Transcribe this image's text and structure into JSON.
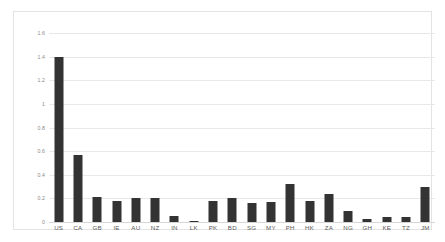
{
  "chart_data": {
    "type": "bar",
    "title": "",
    "subtitle": "",
    "xlabel": "",
    "ylabel": "",
    "categories": [
      "US",
      "CA",
      "GB",
      "IE",
      "AU",
      "NZ",
      "IN",
      "LK",
      "PK",
      "BD",
      "SG",
      "MY",
      "PH",
      "HK",
      "ZA",
      "NG",
      "GH",
      "KE",
      "TZ",
      "JM"
    ],
    "values": [
      1.4,
      0.57,
      0.21,
      0.18,
      0.2,
      0.2,
      0.055,
      0.01,
      0.18,
      0.2,
      0.16,
      0.17,
      0.32,
      0.175,
      0.24,
      0.09,
      0.025,
      0.04,
      0.045,
      0.3
    ],
    "series": [
      {
        "name": "",
        "values": [
          1.4,
          0.57,
          0.21,
          0.18,
          0.2,
          0.2,
          0.055,
          0.01,
          0.18,
          0.2,
          0.16,
          0.17,
          0.32,
          0.175,
          0.24,
          0.09,
          0.025,
          0.04,
          0.045,
          0.3
        ]
      }
    ],
    "ylim": [
      0,
      1.6
    ],
    "yticks": [
      0,
      0.2,
      0.4,
      0.6,
      0.8,
      1,
      1.2,
      1.4,
      1.6
    ],
    "ytick_labels": [
      "0",
      "0.2",
      "0.4",
      "0.6",
      "0.8",
      "1",
      "1.2",
      "1.4",
      "1.6"
    ],
    "grid": true,
    "grid_axis": "y",
    "legend": false,
    "legend_position": "none",
    "annotations": [],
    "colors": {
      "bar": "#333333",
      "gridline": "#e8e8e8",
      "baseline": "#d6d6d6",
      "frame": "#e3e3e3",
      "background": "#ffffff",
      "ytick_text": "#8a8a8a",
      "xtick_text": "#5a5a5a"
    }
  }
}
